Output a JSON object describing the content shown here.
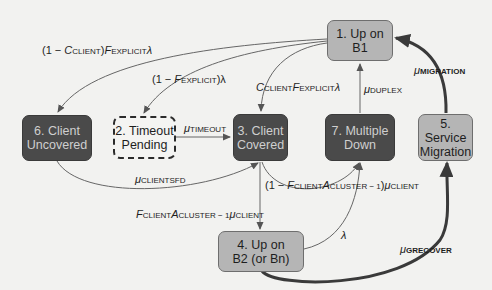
{
  "diagram": {
    "type": "state-transition",
    "colors": {
      "dark_node": "#4a4a4a",
      "light_node": "#b5b5b5",
      "dashed_node": "#f4f4f2",
      "edge": "#555555",
      "thick_edge": "#3a3a3a",
      "background": "#f2f2f0"
    },
    "nodes": [
      {
        "id": "1",
        "label": "1. Up on\nB1",
        "style": "light"
      },
      {
        "id": "2",
        "label": "2. Timeout\nPending",
        "style": "dashed"
      },
      {
        "id": "3",
        "label": "3. Client\nCovered",
        "style": "dark"
      },
      {
        "id": "4",
        "label": "4. Up on\nB2 (or Bn)",
        "style": "light"
      },
      {
        "id": "5",
        "label": "5. Service\nMigration",
        "style": "light"
      },
      {
        "id": "6",
        "label": "6. Client\nUncovered",
        "style": "dark"
      },
      {
        "id": "7",
        "label": "7. Multiple\nDown",
        "style": "dark"
      }
    ],
    "edges": [
      {
        "from": "1",
        "to": "6",
        "label": {
          "pre": "(1 − ",
          "c": "C",
          "c_sub": "CLIENT",
          "mid": ")",
          "f": "F",
          "f_sub": "EXPLICIT",
          "post": "λ"
        }
      },
      {
        "from": "1",
        "to": "2",
        "label": {
          "pre": "(1 − ",
          "f": "F",
          "f_sub": "EXPLICIT",
          "post": ")λ"
        }
      },
      {
        "from": "1",
        "to": "3",
        "label": {
          "c": "C",
          "c_sub": "CLIENT",
          "f": "F",
          "f_sub": "EXPLICIT",
          "post": "λ"
        }
      },
      {
        "from": "2",
        "to": "3",
        "label": {
          "mu": "μ",
          "sub": "TIMEOUT"
        }
      },
      {
        "from": "7",
        "to": "1",
        "label": {
          "mu": "μ",
          "sub": "DUPLEX"
        }
      },
      {
        "from": "5",
        "to": "1",
        "thick": true,
        "label": {
          "mu": "μ",
          "sub": "MIGRATION"
        }
      },
      {
        "from": "6",
        "to": "3",
        "label": {
          "mu": "μ",
          "sub": "CLIENTSFD"
        }
      },
      {
        "from": "3",
        "to": "7",
        "label": {
          "pre": "(1 − ",
          "f": "F",
          "f_sub": "CLIENT",
          "a": "A",
          "a_sub": "CLUSTER − 1",
          "post": ")",
          "mu": "μ",
          "mu_sub": "CLIENT"
        }
      },
      {
        "from": "3",
        "to": "4",
        "label": {
          "f": "F",
          "f_sub": "CLIENT",
          "a": "A",
          "a_sub": "CLUSTER − 1",
          "mu": "μ",
          "mu_sub": "CLIENT"
        }
      },
      {
        "from": "4",
        "to": "3",
        "label": {}
      },
      {
        "from": "4",
        "to": "7",
        "label": {
          "text": "λ"
        }
      },
      {
        "from": "4",
        "to": "5",
        "thick": true,
        "label": {
          "mu": "μ",
          "sub": "GRECOVER"
        }
      }
    ]
  }
}
